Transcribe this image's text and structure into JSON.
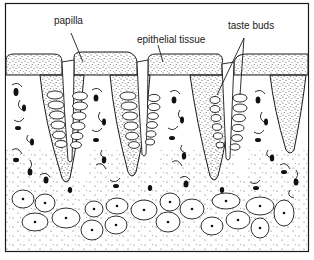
{
  "diagram": {
    "labels": {
      "papilla": "papilla",
      "epithelial_tissue": "epithelial tissue",
      "taste_buds": "taste buds"
    },
    "colors": {
      "ink": "#1a1a1a",
      "paper": "#ffffff",
      "stipple": "#555555"
    }
  }
}
